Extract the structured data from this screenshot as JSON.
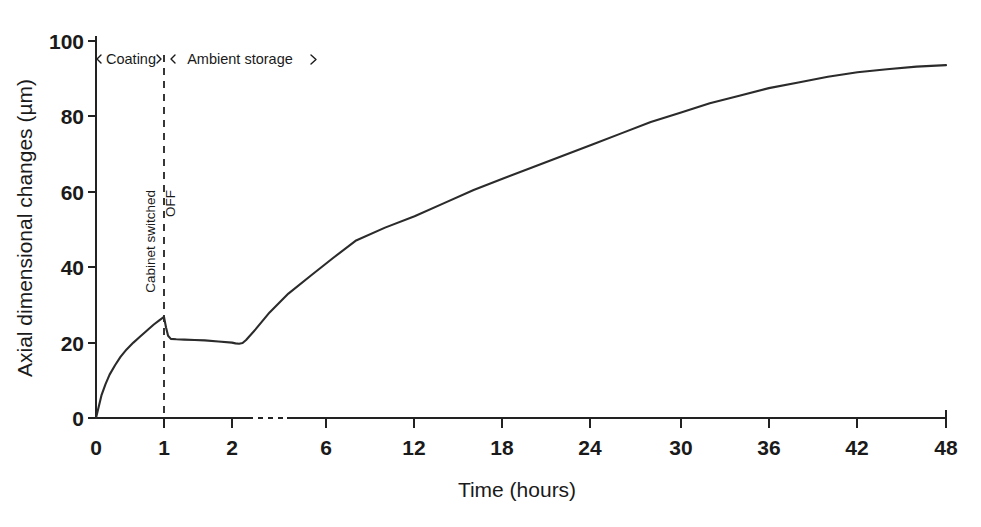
{
  "chart_data": {
    "type": "line",
    "title": "",
    "xlabel": "Time (hours)",
    "ylabel": "Axial dimensional changes (µm)",
    "xlim": [
      0,
      48
    ],
    "ylim": [
      0,
      100
    ],
    "grid": false,
    "legend": "none",
    "x_ticks": [
      "0",
      "1",
      "2",
      "6",
      "12",
      "18",
      "24",
      "30",
      "36",
      "42",
      "48"
    ],
    "x_tick_values": [
      0,
      1,
      2,
      6,
      12,
      18,
      24,
      30,
      36,
      42,
      48
    ],
    "y_ticks": [
      "0",
      "20",
      "40",
      "60",
      "80",
      "100"
    ],
    "y_tick_values": [
      0,
      20,
      40,
      60,
      80,
      100
    ],
    "axis_break": {
      "between": [
        2,
        6
      ],
      "style": "dashed"
    },
    "series": [
      {
        "name": "Axial dimensional change",
        "x": [
          0,
          0.04,
          0.08,
          0.14,
          0.2,
          0.28,
          0.36,
          0.45,
          0.55,
          0.65,
          0.75,
          0.85,
          0.93,
          1.0,
          1.03,
          1.06,
          1.1,
          1.18,
          1.3,
          1.45,
          1.6,
          1.8,
          2.0,
          2.15,
          2.3,
          2.45,
          2.6,
          3.0,
          3.6,
          4.4,
          5.4,
          6.5,
          8.0,
          10.0,
          12.0,
          14.0,
          16.0,
          18.0,
          20.0,
          22.0,
          24.0,
          26.0,
          28.0,
          30.0,
          32.0,
          34.0,
          36.0,
          38.0,
          40.0,
          42.0,
          44.0,
          46.0,
          48.0
        ],
        "y": [
          0.0,
          3.0,
          6.0,
          9.0,
          11.5,
          14.0,
          16.2,
          18.2,
          20.0,
          21.6,
          23.2,
          24.8,
          25.9,
          26.8,
          24.0,
          21.8,
          21.0,
          20.9,
          20.8,
          20.7,
          20.6,
          20.3,
          20.0,
          19.8,
          19.7,
          19.9,
          20.7,
          23.5,
          28.0,
          33.0,
          38.0,
          42.5,
          47.0,
          50.5,
          53.5,
          57.0,
          60.5,
          63.5,
          66.5,
          69.5,
          72.5,
          75.5,
          78.5,
          81.0,
          83.5,
          85.5,
          87.5,
          89.0,
          90.5,
          91.7,
          92.5,
          93.2,
          93.6
        ]
      }
    ],
    "annotations": {
      "phase_left": "Coating",
      "phase_right": "Ambient storage",
      "event_line_1": "Cabinet switched",
      "event_line_2": "OFF",
      "event_at_hours": 1
    },
    "colors": {
      "curve": "#2b2b2b",
      "axis": "#222222",
      "text": "#1a1a1a",
      "background": "#ffffff"
    }
  }
}
